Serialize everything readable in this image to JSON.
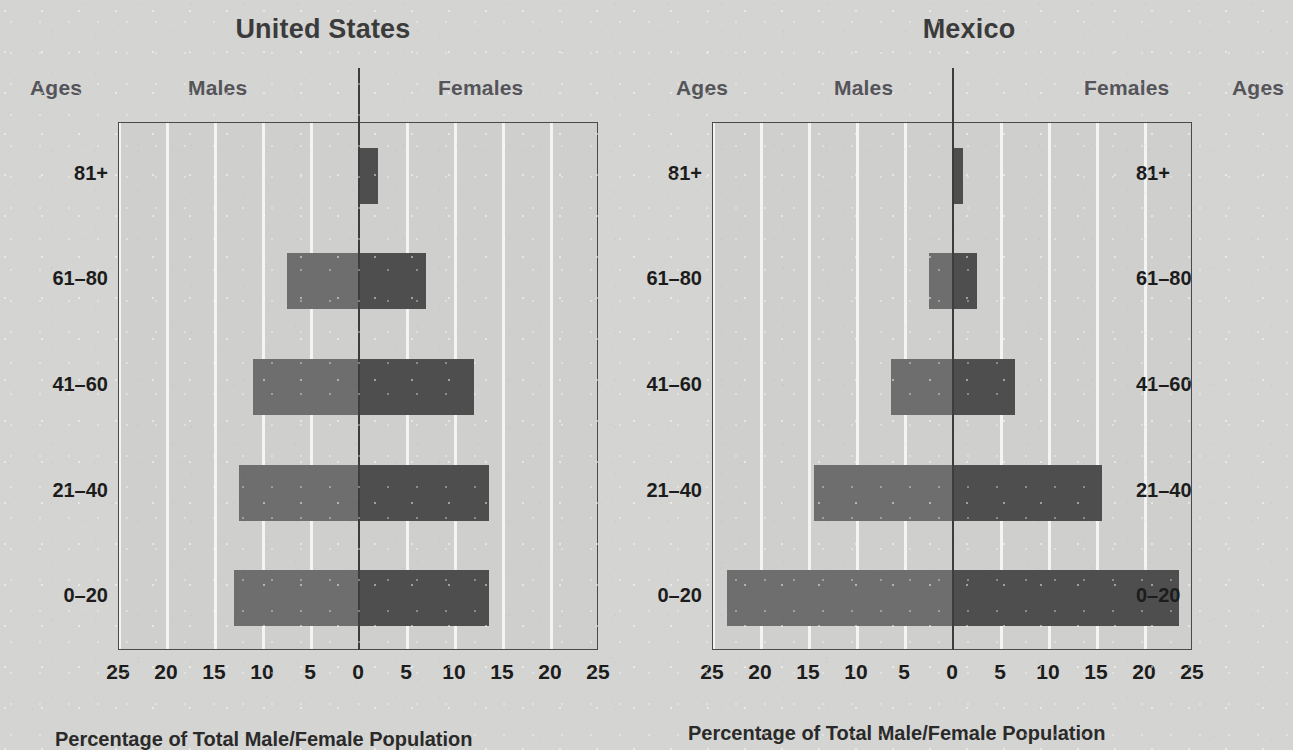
{
  "chart_data": [
    {
      "type": "bar",
      "title": "United States",
      "subtype": "population-pyramid",
      "categories": [
        "81+",
        "61–80",
        "41–60",
        "21–40",
        "0–20"
      ],
      "series": [
        {
          "name": "Males",
          "values": [
            0,
            7.5,
            11,
            12.5,
            13
          ]
        },
        {
          "name": "Females",
          "values": [
            2,
            7,
            12,
            13.5,
            13.5
          ]
        }
      ],
      "xlabel": "Percentage of Total Male/Female Population",
      "ylabel": "Ages",
      "xticks": [
        25,
        20,
        15,
        10,
        5,
        0,
        5,
        10,
        15,
        20,
        25
      ],
      "xlim": [
        -25,
        25
      ],
      "grid": true,
      "legend": "none",
      "left_header": "Ages",
      "right_header": "Ages",
      "male_header": "Males",
      "female_header": "Females"
    },
    {
      "type": "bar",
      "title": "Mexico",
      "subtype": "population-pyramid",
      "categories": [
        "81+",
        "61–80",
        "41–60",
        "21–40",
        "0–20"
      ],
      "series": [
        {
          "name": "Males",
          "values": [
            0,
            2.5,
            6.5,
            14.5,
            23.5
          ]
        },
        {
          "name": "Females",
          "values": [
            1,
            2.5,
            6.5,
            15.5,
            23.5
          ]
        }
      ],
      "xlabel": "Percentage of Total Male/Female Population",
      "ylabel": "Ages",
      "xticks": [
        25,
        20,
        15,
        10,
        5,
        0,
        5,
        10,
        15,
        20,
        25
      ],
      "xlim": [
        -25,
        25
      ],
      "grid": true,
      "legend": "none",
      "left_header": "Ages",
      "right_header": "Ages",
      "male_header": "Males",
      "female_header": "Females"
    }
  ],
  "colors": {
    "male_bar": "#6e6e6e",
    "female_bar": "#4e4e4e",
    "background": "#d4d4d2",
    "plot_background": "#cfcfcd",
    "gridline": "#f4f4f2",
    "axis": "#4a4a4a",
    "title_text": "#3b3b3b",
    "header_text": "#54545a",
    "label_text": "#1c1c1c"
  },
  "captions": {
    "us": "Percentage of Total Male/Female Population",
    "mexico": "Percentage of Total Male/Female Population"
  }
}
